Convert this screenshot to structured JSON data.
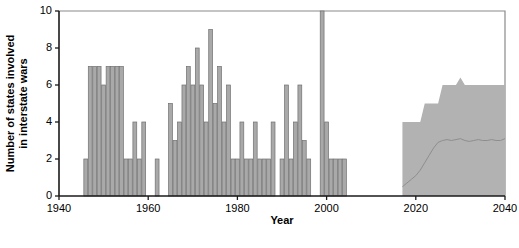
{
  "chart_data": {
    "type": "bar",
    "title": "",
    "xlabel": "Year",
    "ylabel": "Number of states involved in interstate wars",
    "xlim": [
      1940,
      2040
    ],
    "ylim": [
      0,
      10
    ],
    "xticks": [
      1940,
      1960,
      1980,
      2000,
      2020,
      2040
    ],
    "yticks": [
      0,
      2,
      4,
      6,
      8,
      10
    ],
    "grid": false,
    "legend": null,
    "series": [
      {
        "name": "Observed states involved in interstate wars",
        "type": "bar",
        "x": [
          1946,
          1947,
          1948,
          1949,
          1950,
          1951,
          1952,
          1953,
          1954,
          1955,
          1956,
          1957,
          1958,
          1959,
          1960,
          1961,
          1962,
          1963,
          1964,
          1965,
          1966,
          1967,
          1968,
          1969,
          1970,
          1971,
          1972,
          1973,
          1974,
          1975,
          1976,
          1977,
          1978,
          1979,
          1980,
          1981,
          1982,
          1983,
          1984,
          1985,
          1986,
          1987,
          1988,
          1989,
          1990,
          1991,
          1992,
          1993,
          1994,
          1995,
          1996,
          1997,
          1998,
          1999,
          2000,
          2001,
          2002,
          2003,
          2004
        ],
        "values": [
          2,
          7,
          7,
          7,
          6,
          7,
          7,
          7,
          7,
          2,
          2,
          4,
          2,
          4,
          0,
          0,
          2,
          0,
          0,
          5,
          3,
          4,
          6,
          7,
          6,
          8,
          6,
          4,
          9,
          5,
          7,
          4,
          6,
          2,
          2,
          4,
          2,
          2,
          4,
          2,
          2,
          2,
          4,
          0,
          2,
          6,
          2,
          4,
          6,
          3,
          2,
          0,
          0,
          10,
          4,
          2,
          2,
          2,
          2
        ]
      },
      {
        "name": "Projected range (uncertainty band)",
        "type": "band",
        "x": [
          2017,
          2018,
          2019,
          2020,
          2021,
          2022,
          2023,
          2024,
          2025,
          2026,
          2027,
          2028,
          2029,
          2030,
          2031,
          2032,
          2033,
          2034,
          2035,
          2036,
          2037,
          2038,
          2039,
          2040
        ],
        "lower": [
          0,
          0,
          0,
          0,
          0,
          0,
          0,
          0,
          0,
          0,
          0,
          0,
          0,
          0,
          0,
          0,
          0,
          0,
          0,
          0,
          0,
          0,
          0,
          0
        ],
        "upper": [
          4,
          4,
          4,
          4,
          4,
          5,
          5,
          5,
          5,
          6,
          6,
          6,
          6,
          6.4,
          6,
          6,
          6,
          6,
          6,
          6,
          6,
          6,
          6,
          6
        ]
      },
      {
        "name": "Projected median",
        "type": "line",
        "x": [
          2017,
          2018,
          2019,
          2020,
          2021,
          2022,
          2023,
          2024,
          2025,
          2026,
          2027,
          2028,
          2029,
          2030,
          2031,
          2032,
          2033,
          2034,
          2035,
          2036,
          2037,
          2038,
          2039,
          2040
        ],
        "values": [
          0.5,
          0.7,
          0.9,
          1.1,
          1.4,
          1.8,
          2.2,
          2.6,
          2.9,
          3.0,
          3.05,
          3.0,
          3.05,
          3.1,
          3.0,
          2.95,
          3.0,
          3.05,
          3.0,
          3.0,
          3.05,
          3.0,
          3.0,
          3.1
        ]
      }
    ],
    "colors": {
      "bar_fill": "#a9a9a9",
      "bar_stroke": "#707070",
      "band_fill": "#b2b2b2",
      "median_line": "#8e8e8e",
      "axis": "#1a1a1a",
      "frame": "#8a8a8a",
      "text": "#000000"
    }
  }
}
